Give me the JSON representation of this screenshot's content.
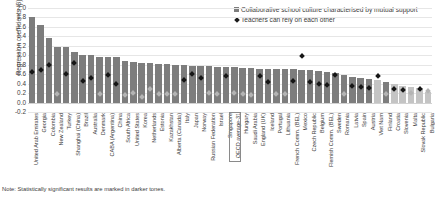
{
  "legend": {
    "items": [
      {
        "icon": "square-marker",
        "label": "Collaborative school culture characterised by mutual support"
      },
      {
        "icon": "diamond-marker",
        "label": "Teachers can rely on each other"
      }
    ]
  },
  "note": "Note: Statistically significant results are marked in darker tones.",
  "colors": {
    "bar_dark": "#7d7d7d",
    "bar_light": "#c4c4c4",
    "marker_dark": "#161616",
    "marker_light": "#b4b4b4",
    "grid": "#e6e6e6"
  },
  "chart_data": {
    "type": "bar",
    "title": "",
    "xlabel": "",
    "ylabel": "Regression coefficients (β)",
    "ylim": [
      -0.2,
      2.0
    ],
    "yticks": [
      "2.0",
      "1.8",
      "1.6",
      "1.4",
      "1.2",
      "1.0",
      "0.8",
      "0.6",
      "0.4",
      "0.2",
      "0.0",
      "-0.2"
    ],
    "grid": true,
    "legend_position": "top-right",
    "highlight_category": "OECD average-31",
    "categories": [
      "United Arab Emirates",
      "Georgia",
      "Colombia",
      "New Zealand",
      "Turkey",
      "Shanghai (China)",
      "Brazil",
      "Australia",
      "Denmark",
      "CABA (Argentina)",
      "China",
      "South Africa",
      "United States",
      "Korea",
      "Netherlands",
      "Estonia",
      "Kazakhstan",
      "Alberta (Canada)",
      "Italy",
      "Japan",
      "Norway",
      "Russian Federation",
      "Israel",
      "Singapore",
      "OECD average-31",
      "Hungary",
      "Saudi Arabia",
      "England (UK)",
      "Iceland",
      "Portugal",
      "Lithuania",
      "French Comm. (BEL)",
      "Mexico",
      "Czech Republic",
      "Belgium",
      "Flemish Comm. (BEL)",
      "Sweden",
      "Romania",
      "Latvia",
      "Spain",
      "Austria",
      "Viet Nam",
      "Finland",
      "Croatia",
      "Slovenia",
      "Malta",
      "Slovak Republic",
      "Bulgaria"
    ],
    "series": [
      {
        "name": "Collaborative school culture characterised by mutual support",
        "type": "bar",
        "values": [
          1.82,
          1.65,
          1.37,
          1.18,
          1.17,
          1.06,
          1.0,
          1.0,
          0.97,
          0.96,
          0.96,
          0.88,
          0.86,
          0.84,
          0.84,
          0.82,
          0.81,
          0.8,
          0.79,
          0.78,
          0.78,
          0.77,
          0.76,
          0.76,
          0.75,
          0.74,
          0.73,
          0.72,
          0.72,
          0.71,
          0.7,
          0.7,
          0.69,
          0.68,
          0.66,
          0.65,
          0.62,
          0.58,
          0.55,
          0.52,
          0.5,
          0.47,
          0.44,
          0.4,
          0.36,
          0.33,
          0.3,
          0.22
        ],
        "significant": [
          true,
          true,
          true,
          true,
          true,
          true,
          true,
          true,
          true,
          true,
          true,
          true,
          true,
          true,
          true,
          true,
          true,
          true,
          true,
          true,
          true,
          true,
          true,
          true,
          true,
          true,
          true,
          true,
          true,
          true,
          true,
          true,
          true,
          true,
          true,
          true,
          true,
          true,
          true,
          true,
          true,
          false,
          true,
          false,
          false,
          false,
          false,
          false
        ]
      },
      {
        "name": "Teachers can rely on each other",
        "type": "scatter",
        "values": [
          0.66,
          0.7,
          0.8,
          0.2,
          0.62,
          0.84,
          0.46,
          0.52,
          0.19,
          0.6,
          0.4,
          0.16,
          0.22,
          0.12,
          0.3,
          0.2,
          0.2,
          0.2,
          0.48,
          0.62,
          0.52,
          0.22,
          0.2,
          0.56,
          0.22,
          0.2,
          0.17,
          0.58,
          0.44,
          0.2,
          0.18,
          0.46,
          1.0,
          0.44,
          0.4,
          0.38,
          0.6,
          0.2,
          0.36,
          0.34,
          0.32,
          0.56,
          0.2,
          0.3,
          0.28,
          0.22,
          0.3,
          0.26
        ],
        "significant": [
          true,
          true,
          true,
          false,
          true,
          true,
          true,
          true,
          false,
          true,
          true,
          false,
          false,
          false,
          false,
          false,
          false,
          false,
          true,
          true,
          true,
          false,
          false,
          true,
          false,
          false,
          false,
          true,
          true,
          false,
          false,
          true,
          true,
          true,
          true,
          true,
          true,
          false,
          true,
          true,
          true,
          true,
          false,
          true,
          true,
          false,
          true,
          false
        ]
      }
    ]
  }
}
